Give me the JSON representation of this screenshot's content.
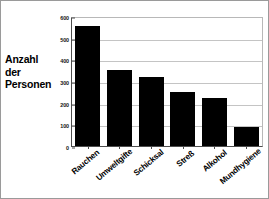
{
  "chart_data": {
    "type": "bar",
    "title": "",
    "subtitle": "",
    "xlabel": "",
    "ylabel": "Anzahl der Personen",
    "categories": [
      "Rauchen",
      "Umweltgifte",
      "Schicksal",
      "Streß",
      "Alkohol",
      "Mundhygiene"
    ],
    "values": [
      555,
      350,
      320,
      250,
      220,
      90
    ],
    "ylim": [
      0,
      600
    ],
    "yticks": [
      0,
      100,
      200,
      300,
      400,
      500,
      600
    ],
    "ytick_labels": [
      "0",
      "100",
      "200",
      "300",
      "400",
      "500",
      "600"
    ],
    "grid": true,
    "legend": false,
    "bar_color": "#000000",
    "background_color": "#ffffff",
    "gridline_color": "#c4c4c4",
    "axis_color": "#4d4d4d"
  },
  "axis_title": {
    "line1": "Anzahl",
    "line2": "der",
    "line3": "Personen"
  }
}
